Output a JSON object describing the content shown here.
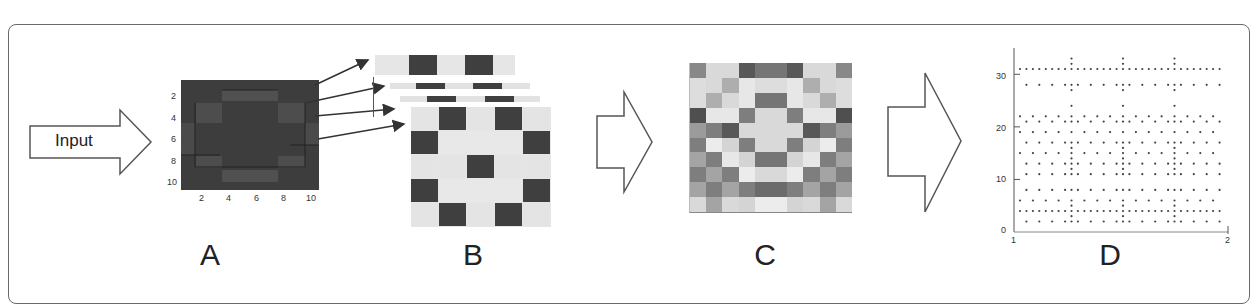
{
  "figure": {
    "input_arrow_label": "Input",
    "panels": [
      {
        "id": "A",
        "label": "A"
      },
      {
        "id": "B",
        "label": "B"
      },
      {
        "id": "C",
        "label": "C"
      },
      {
        "id": "D",
        "label": "D"
      }
    ]
  },
  "panel_a": {
    "x_ticks": [
      "2",
      "4",
      "6",
      "8",
      "10"
    ],
    "y_ticks": [
      "2",
      "4",
      "6",
      "8",
      "10"
    ],
    "background_color": "#3d3d3d"
  },
  "panel_b": {
    "layers": 4,
    "main_grid": [
      [
        0,
        1,
        0,
        1,
        0
      ],
      [
        1,
        0,
        0,
        0,
        1
      ],
      [
        0,
        0,
        1,
        0,
        0
      ],
      [
        1,
        0,
        0,
        0,
        1
      ],
      [
        0,
        1,
        0,
        1,
        0
      ]
    ],
    "strip_top": [
      0,
      1,
      0,
      1,
      0
    ],
    "dark_color": "#3f3f3f",
    "light_color": "#e6e6e6"
  },
  "panel_c": {
    "grid": [
      [
        0.55,
        0.12,
        0.12,
        0.8,
        0.65,
        0.65,
        0.8,
        0.12,
        0.12,
        0.55
      ],
      [
        0.1,
        0.12,
        0.35,
        0.05,
        0.1,
        0.1,
        0.05,
        0.35,
        0.12,
        0.1
      ],
      [
        0.1,
        0.35,
        0.12,
        0.05,
        0.65,
        0.65,
        0.05,
        0.12,
        0.35,
        0.1
      ],
      [
        0.85,
        0.05,
        0.05,
        0.6,
        0.12,
        0.12,
        0.6,
        0.05,
        0.05,
        0.85
      ],
      [
        0.45,
        0.6,
        0.8,
        0.12,
        0.12,
        0.12,
        0.12,
        0.8,
        0.6,
        0.45
      ],
      [
        0.6,
        0.02,
        0.15,
        0.6,
        0.12,
        0.12,
        0.6,
        0.15,
        0.02,
        0.6
      ],
      [
        0.4,
        0.6,
        0.05,
        0.15,
        0.65,
        0.65,
        0.15,
        0.05,
        0.6,
        0.4
      ],
      [
        0.6,
        0.4,
        0.6,
        0.02,
        0.12,
        0.12,
        0.02,
        0.6,
        0.4,
        0.6
      ],
      [
        0.4,
        0.6,
        0.4,
        0.6,
        0.7,
        0.7,
        0.6,
        0.4,
        0.6,
        0.4
      ],
      [
        0.12,
        0.4,
        0.12,
        0.15,
        0.02,
        0.02,
        0.15,
        0.12,
        0.4,
        0.12
      ]
    ]
  },
  "panel_d": {
    "y_ticks": [
      "0",
      "10",
      "20",
      "30"
    ],
    "x_ticks": [
      "1",
      "2"
    ],
    "ylim": [
      0,
      35
    ],
    "xlim": [
      1,
      2
    ]
  }
}
